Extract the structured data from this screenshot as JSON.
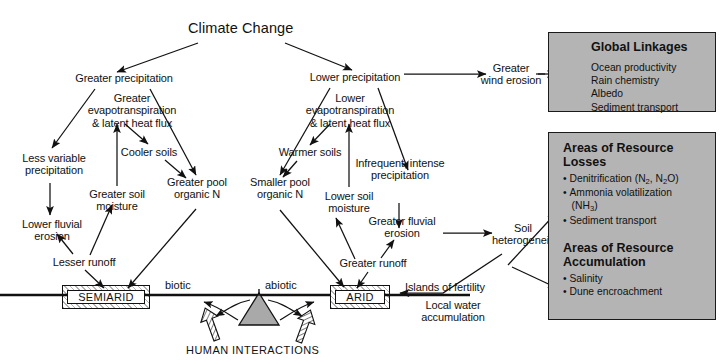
{
  "figure": {
    "title": "Climate Change",
    "domain": "conceptual flow diagram"
  },
  "nodes": {
    "climate_change": "Climate Change",
    "greater_precipitation": "Greater precipitation",
    "lower_precipitation": "Lower precipitation",
    "greater_evapotranspiration": "Greater\nevapotranspiration\n& latent heat flux",
    "lower_evapotranspiration": "Lower\nevapotranspiration\n& latent heat flux",
    "less_variable_precipitation": "Less variable\nprecipitation",
    "cooler_soils": "Cooler soils",
    "warmer_soils": "Warmer soils",
    "greater_soil_moisture": "Greater soil\nmoisture",
    "lower_soil_moisture": "Lower soil\nmoisture",
    "greater_pool_organic_n": "Greater pool\norganic N",
    "smaller_pool_organic_n": "Smaller pool\norganic N",
    "infrequent_intense_precipitation": "Infrequent, intense\nprecipitation",
    "lower_fluvial_erosion": "Lower fluvial\nerosion",
    "greater_fluvial_erosion": "Greater fluvial\nerosion",
    "lesser_runoff": "Lesser runoff",
    "greater_runoff": "Greater runoff",
    "greater_wind_erosion": "Greater\nwind erosion",
    "soil_heterogeneity": "Soil\nheterogeneity",
    "islands_of_fertility": "Islands of fertility",
    "local_water_accumulation": "Local water\naccumulation",
    "semiarid": "SEMIARID",
    "arid": "ARID",
    "biotic": "biotic",
    "abiotic": "abiotic",
    "human_interactions": "HUMAN INTERACTIONS"
  },
  "panels": {
    "global_linkages": {
      "heading": "Global Linkages",
      "items": [
        "Ocean productivity",
        "Rain chemistry",
        "Albedo",
        "Sediment transport"
      ]
    },
    "resource_losses": {
      "heading": "Areas of Resource\nLosses",
      "items": [
        "• Denitrification (N2, N2O)",
        "• Ammonia volatilization",
        "   (NH3)",
        "• Sediment transport"
      ],
      "items_rich": [
        {
          "prefix": "• Denitrification (N",
          "sub1": "2",
          "mid": ", N",
          "sub2": "2",
          "suffix": "O)"
        },
        {
          "prefix": "• Ammonia volatilization",
          "sub1": "",
          "mid": "",
          "sub2": "",
          "suffix": ""
        },
        {
          "prefix": "(NH",
          "sub1": "3",
          "mid": ")",
          "sub2": "",
          "suffix": ""
        },
        {
          "prefix": "• Sediment transport",
          "sub1": "",
          "mid": "",
          "sub2": "",
          "suffix": ""
        }
      ]
    },
    "resource_accumulation": {
      "heading": "Areas of Resource\nAccumulation",
      "items": [
        "• Salinity",
        "• Dune encroachment"
      ]
    }
  },
  "colors": {
    "background": "#ffffff",
    "ink": "#111111",
    "panel_fill": "#b4b4b4",
    "panel_border": "#1a1a1a",
    "fulcrum_fill": "#a9a9a9"
  }
}
